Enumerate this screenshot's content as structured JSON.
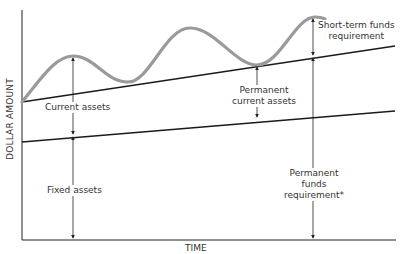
{
  "diagram": {
    "axes": {
      "x_label": "TIME",
      "y_label": "DOLLAR AMOUNT"
    },
    "labels": {
      "current_assets": "Current assets",
      "fixed_assets": "Fixed assets",
      "permanent_current_assets_1": "Permanent",
      "permanent_current_assets_2": "current assets",
      "short_term_1": "Short-term funds",
      "short_term_2": "requirement",
      "permanent_funds_1": "Permanent",
      "permanent_funds_2": "funds",
      "permanent_funds_3": "requirement*"
    },
    "colors": {
      "axis": "#222222",
      "lines": "#1a1a1a",
      "curve": "#9a9a9a",
      "text": "#333333"
    }
  }
}
